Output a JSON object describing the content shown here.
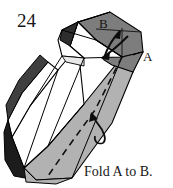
{
  "figure": {
    "number": "24",
    "caption": "Fold A to B.",
    "labels": {
      "a": "A",
      "b": "B"
    },
    "type": "paper-folding-puzzle-diagram",
    "colors": {
      "paper_white": "#ffffff",
      "face_light_gray": "#b2b2b2",
      "face_mid_gray": "#7d7d7d",
      "face_dark_gray": "#565656",
      "face_black": "#1c1c1c",
      "outline": "#000000",
      "text": "#161616"
    },
    "annotations": [
      {
        "name": "fold-arrow-top",
        "description": "curved arrow from point A region toward point B"
      },
      {
        "name": "fold-arrow-lower",
        "description": "curved arrow pointing up along the lower body"
      },
      {
        "name": "crease-line",
        "description": "dashed diagonal crease running down the shaded face"
      }
    ]
  }
}
